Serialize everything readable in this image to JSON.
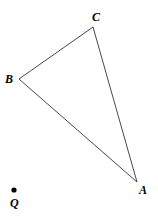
{
  "diagram": {
    "type": "geometry-triangle",
    "points": {
      "A": {
        "label": "A",
        "x": 137,
        "y": 182
      },
      "B": {
        "label": "B",
        "x": 19,
        "y": 79
      },
      "C": {
        "label": "C",
        "x": 93,
        "y": 27
      },
      "Q": {
        "label": "Q",
        "x": 14,
        "y": 190
      }
    },
    "triangle": [
      "A",
      "B",
      "C"
    ],
    "edges": [
      [
        "B",
        "C"
      ],
      [
        "C",
        "A"
      ],
      [
        "A",
        "B"
      ]
    ],
    "standalone_points": [
      "Q"
    ]
  }
}
